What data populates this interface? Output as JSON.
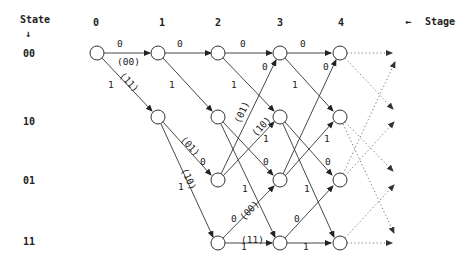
{
  "header": {
    "state_label": "State",
    "stage_label": "Stage",
    "stage_arrow": "←",
    "state_arrow": "↓"
  },
  "stages": [
    "0",
    "1",
    "2",
    "3",
    "4"
  ],
  "states": [
    "00",
    "10",
    "01",
    "11"
  ],
  "edge_labels": {
    "s00_00_in": "0",
    "s00_00_out": "(00)",
    "s00_10_in": "1",
    "s00_10_out": "(11)",
    "s1_00_00": "0",
    "s1_00_10": "1",
    "s1_10_01_in": "0",
    "s1_10_01_out": "(01)",
    "s1_10_11_in": "1",
    "s1_10_11_out": "(10)",
    "s2_00_00": "0",
    "s2_00_10": "1",
    "s2_01_00_out": "(01)",
    "s2_01_00_in": "0",
    "s2_01_10_out": "(10)",
    "s2_01_10_in": "1",
    "s2_10_01": "0",
    "s2_10_11": "1",
    "s2_11_01_in": "0",
    "s2_11_01_out": "(00)",
    "s2_11_11_in": "1",
    "s2_11_11_out": "(11)",
    "s3_00_00": "0",
    "s3_00_10": "1",
    "s3_01_00": "0",
    "s3_01_10": "1",
    "s3_10_01": "0",
    "s3_10_11": "1",
    "s3_11_01": "0",
    "s3_11_11": "1"
  }
}
